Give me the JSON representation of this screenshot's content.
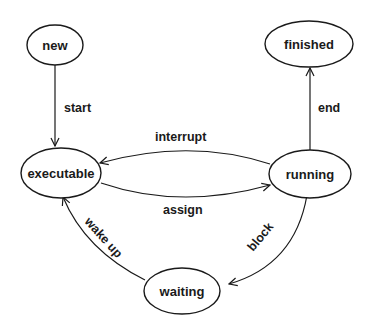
{
  "diagram": {
    "type": "state-transition",
    "nodes": [
      {
        "id": "new",
        "label": "new"
      },
      {
        "id": "finished",
        "label": "finished"
      },
      {
        "id": "executable",
        "label": "executable"
      },
      {
        "id": "running",
        "label": "running"
      },
      {
        "id": "waiting",
        "label": "waiting"
      }
    ],
    "edges": [
      {
        "from": "new",
        "to": "executable",
        "label": "start"
      },
      {
        "from": "running",
        "to": "finished",
        "label": "end"
      },
      {
        "from": "running",
        "to": "executable",
        "label": "interrupt"
      },
      {
        "from": "executable",
        "to": "running",
        "label": "assign"
      },
      {
        "from": "running",
        "to": "waiting",
        "label": "block"
      },
      {
        "from": "waiting",
        "to": "executable",
        "label": "wake up"
      }
    ]
  }
}
